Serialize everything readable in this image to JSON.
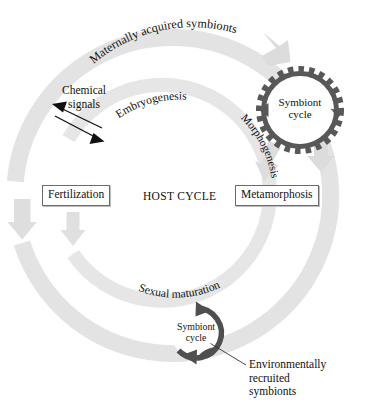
{
  "diagram": {
    "type": "cycle-diagram",
    "center_label": "HOST CYCLE",
    "colors": {
      "outer_arc": "#e3e3e3",
      "inner_arc": "#e6e6e6",
      "symbiont_ring_dark": "#585858",
      "symbiont_ring_lower": "#4f4f4f",
      "text": "#111111",
      "box_border": "#6b6b6b",
      "background": "#ffffff"
    },
    "outer_cycle": {
      "label": "Maternally acquired symbionts",
      "arrow_direction": "clockwise"
    },
    "inner_cycle": {
      "labels": [
        "Embryogenesis",
        "Morphogenesis",
        "Sexual maturation"
      ],
      "arrow_direction": "clockwise"
    },
    "stages": [
      {
        "name": "fertilization",
        "label": "Fertilization",
        "boxed": true
      },
      {
        "name": "metamorphosis",
        "label": "Metamorphosis",
        "boxed": true
      }
    ],
    "symbiont_cycles": [
      {
        "name": "upper-symbiont-cycle",
        "line1": "Symbiont",
        "line2": "cycle",
        "style": "gear-toothed-ring"
      },
      {
        "name": "lower-symbiont-cycle",
        "line1": "Symbiont",
        "line2": "cycle",
        "style": "solid-ring-with-arrowheads"
      }
    ],
    "annotations": [
      {
        "name": "chemical-signals",
        "line1": "Chemical",
        "line2": "signals",
        "arrows": "double-headed-opposing"
      },
      {
        "name": "environmentally-recruited-symbionts",
        "line1": "Environmentally",
        "line2": "recruited",
        "line3": "symbionts",
        "leader_line": true
      }
    ]
  }
}
